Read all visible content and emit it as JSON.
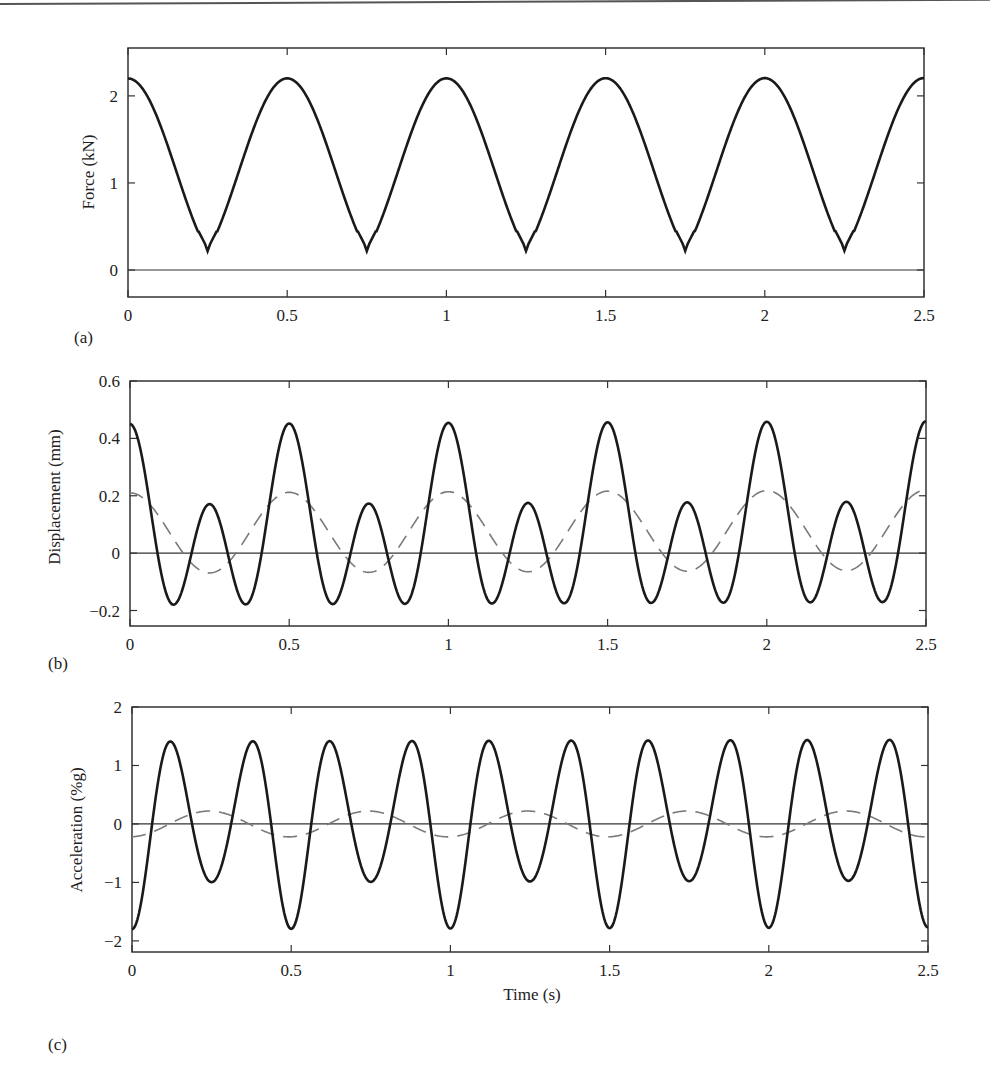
{
  "chart_data": [
    {
      "panel": "(a)",
      "type": "line",
      "title": "",
      "xlabel": "",
      "ylabel": "Force (kN)",
      "xlim": [
        0,
        2.5
      ],
      "ylim": [
        -0.31,
        2.55
      ],
      "xticks": [
        0,
        0.5,
        1,
        1.5,
        2,
        2.5
      ],
      "xtick_labels": [
        "0",
        "0.5",
        "1",
        "1.5",
        "2",
        "2.5"
      ],
      "yticks": [
        0,
        1,
        2
      ],
      "ytick_labels": [
        "0",
        "1",
        "2"
      ],
      "grid": false,
      "zero_line": true,
      "series": [
        {
          "name": "Force",
          "style": "solid",
          "x": [
            0,
            0.05,
            0.1,
            0.15,
            0.2,
            0.25,
            0.3,
            0.35,
            0.4,
            0.45,
            0.5,
            0.55,
            0.6,
            0.65,
            0.7,
            0.75,
            0.8,
            0.85,
            0.9,
            0.95,
            1.0,
            1.5,
            2.0,
            2.5
          ],
          "values": [
            2.2,
            1.7,
            0.55,
            -0.05,
            0.04,
            0.0,
            0.04,
            -0.05,
            0.55,
            1.7,
            2.2,
            1.7,
            0.55,
            -0.05,
            0.04,
            0.0,
            0.04,
            -0.05,
            0.55,
            1.7,
            2.2,
            2.2,
            2.22,
            2.22
          ]
        }
      ]
    },
    {
      "panel": "(b)",
      "type": "line",
      "title": "",
      "xlabel": "",
      "ylabel": "Displacement (mm)",
      "xlim": [
        0,
        2.5
      ],
      "ylim": [
        -0.254,
        0.6
      ],
      "xticks": [
        0,
        0.5,
        1,
        1.5,
        2,
        2.5
      ],
      "xtick_labels": [
        "0",
        "0.5",
        "1",
        "1.5",
        "2",
        "2.5"
      ],
      "yticks": [
        -0.2,
        0,
        0.2,
        0.4,
        0.6
      ],
      "ytick_labels": [
        "−0.2",
        "0",
        "0.2",
        "0.4",
        "0.6"
      ],
      "grid": false,
      "zero_line": true,
      "series": [
        {
          "name": "Displacement (total)",
          "style": "solid",
          "x": [
            0,
            0.125,
            0.25,
            0.375,
            0.5,
            0.625,
            0.75,
            0.875,
            1.0,
            1.25,
            1.5,
            1.75,
            2.0,
            2.25,
            2.5
          ],
          "values": [
            0.45,
            -0.17,
            0.16,
            -0.15,
            0.45,
            -0.17,
            0.16,
            -0.15,
            0.45,
            0.16,
            0.45,
            0.16,
            0.46,
            0.17,
            0.46
          ]
        },
        {
          "name": "Displacement (first harmonic)",
          "style": "dashed",
          "x": [
            0,
            0.125,
            0.25,
            0.375,
            0.5,
            0.75,
            1.0,
            1.25,
            1.5,
            1.75,
            2.0,
            2.25,
            2.5
          ],
          "values": [
            0.21,
            0.07,
            -0.07,
            0.07,
            0.21,
            -0.07,
            0.21,
            -0.07,
            0.21,
            -0.07,
            0.22,
            -0.07,
            0.22
          ]
        }
      ]
    },
    {
      "panel": "(c)",
      "type": "line",
      "title": "",
      "xlabel": "Time (s)",
      "ylabel": "Acceleration (%g)",
      "xlim": [
        0,
        2.5
      ],
      "ylim": [
        -2.19,
        2.0
      ],
      "xticks": [
        0,
        0.5,
        1,
        1.5,
        2,
        2.5
      ],
      "xtick_labels": [
        "0",
        "0.5",
        "1",
        "1.5",
        "2",
        "2.5"
      ],
      "yticks": [
        -2,
        -1,
        0,
        1,
        2
      ],
      "ytick_labels": [
        "−2",
        "−1",
        "0",
        "1",
        "2"
      ],
      "grid": false,
      "zero_line": true,
      "series": [
        {
          "name": "Acceleration (total)",
          "style": "solid",
          "x": [
            0,
            0.125,
            0.25,
            0.375,
            0.5,
            0.625,
            0.75,
            0.875,
            1.0,
            1.125,
            1.25,
            1.375,
            1.5,
            1.625,
            1.75,
            1.875,
            2.0,
            2.125,
            2.25,
            2.375,
            2.5
          ],
          "values": [
            -1.8,
            1.4,
            -1.35,
            1.37,
            -1.8,
            1.4,
            -1.33,
            1.38,
            -1.78,
            1.42,
            -1.33,
            1.4,
            -1.77,
            1.43,
            -1.3,
            1.4,
            -1.75,
            1.45,
            -1.28,
            1.42,
            -1.7
          ]
        },
        {
          "name": "Acceleration (first harmonic)",
          "style": "dashed",
          "x": [
            0,
            0.125,
            0.25,
            0.375,
            0.5,
            0.75,
            1.0,
            1.25,
            1.5,
            1.75,
            2.0,
            2.25,
            2.5
          ],
          "values": [
            -0.22,
            0.0,
            0.22,
            0.0,
            -0.22,
            0.22,
            -0.22,
            0.22,
            -0.22,
            0.22,
            -0.22,
            0.22,
            -0.22
          ]
        }
      ]
    }
  ],
  "models": {
    "force": {
      "peak": 2.2,
      "pulse_half_width": 0.17,
      "period": 0.5
    },
    "displacement": {
      "offset": 0.07,
      "h1_amp": 0.14,
      "h2_amp": 0.24,
      "h3_amp": 0.0,
      "period": 0.5
    },
    "acceleration": {
      "h1_amp": -0.22,
      "h2_amp": -1.4,
      "h3_amp": -0.18,
      "period": 0.5
    }
  },
  "labels": {
    "panel_a": "(a)",
    "panel_b": "(b)",
    "panel_c": "(c)",
    "ylabel_a": "Force (kN)",
    "ylabel_b": "Displacement (mm)",
    "ylabel_c": "Acceleration (%g)",
    "xlabel_c": "Time (s)"
  },
  "colors": {
    "solid_line": "#1a1a1a",
    "dashed_line": "#7a7a7a",
    "axes": "#333333"
  }
}
